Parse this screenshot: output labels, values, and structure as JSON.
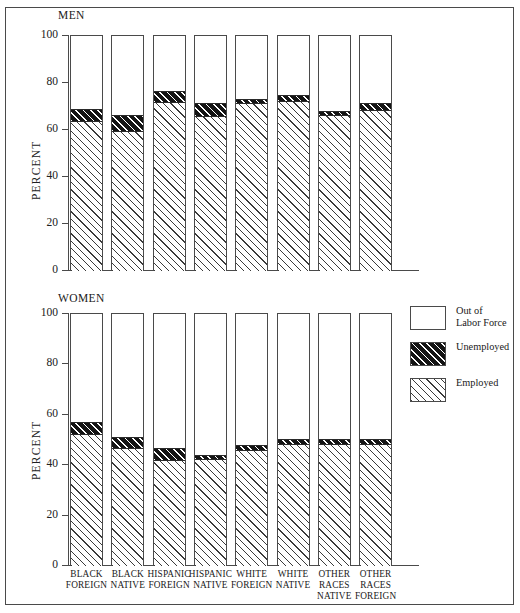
{
  "chart_data": {
    "type": "bar",
    "title": "",
    "subtype": "stacked-percentage",
    "panels": [
      {
        "name": "men",
        "label": "MEN",
        "ylabel": "PERCENT",
        "ylim": [
          0,
          100
        ],
        "yticks": [
          0,
          20,
          40,
          60,
          80,
          100
        ],
        "categories": [
          "BLACK FOREIGN",
          "BLACK NATIVE",
          "HISPANIC FOREIGN",
          "HISPANIC NATIVE",
          "WHITE FOREIGN",
          "WHITE NATIVE",
          "OTHER RACES NATIVE",
          "OTHER RACES FOREIGN"
        ],
        "series": [
          {
            "name": "Employed",
            "values": [
              63.5,
              59.0,
              71.5,
              65.5,
              71.0,
              72.0,
              66.0,
              68.0
            ]
          },
          {
            "name": "Unemployed",
            "values": [
              5.5,
              7.5,
              5.0,
              6.0,
              2.0,
              3.0,
              2.0,
              3.5
            ]
          },
          {
            "name": "Out of Labor Force",
            "values": [
              31.0,
              33.5,
              23.5,
              28.5,
              27.0,
              25.0,
              32.0,
              28.5
            ]
          }
        ]
      },
      {
        "name": "women",
        "label": "WOMEN",
        "ylabel": "PERCENT",
        "ylim": [
          0,
          100
        ],
        "yticks": [
          0,
          20,
          40,
          60,
          80,
          100
        ],
        "categories": [
          "BLACK FOREIGN",
          "BLACK NATIVE",
          "HISPANIC FOREIGN",
          "HISPANIC NATIVE",
          "WHITE FOREIGN",
          "WHITE NATIVE",
          "OTHER RACES NATIVE",
          "OTHER RACES FOREIGN"
        ],
        "series": [
          {
            "name": "Employed",
            "values": [
              52.0,
              46.5,
              41.5,
              42.0,
              45.5,
              48.0,
              48.0,
              48.0
            ]
          },
          {
            "name": "Unemployed",
            "values": [
              5.0,
              4.5,
              5.5,
              2.0,
              2.5,
              2.5,
              2.5,
              2.5
            ]
          },
          {
            "name": "Out of Labor Force",
            "values": [
              43.0,
              49.0,
              53.0,
              56.0,
              52.0,
              49.5,
              49.5,
              49.5
            ]
          }
        ]
      }
    ],
    "legend": {
      "position": "right",
      "entries": [
        {
          "key": "out",
          "label": "Out of\nLabor Force",
          "swatch": "white-empty"
        },
        {
          "key": "unemployed",
          "label": "Unemployed",
          "swatch": "dark-hatched"
        },
        {
          "key": "employed",
          "label": "Employed",
          "swatch": "light-hatched"
        }
      ]
    },
    "xtick_labels": [
      [
        "BLACK",
        "FOREIGN"
      ],
      [
        "BLACK",
        "NATIVE"
      ],
      [
        "HISPANIC",
        "FOREIGN"
      ],
      [
        "HISPANIC",
        "NATIVE"
      ],
      [
        "WHITE",
        "FOREIGN"
      ],
      [
        "WHITE",
        "NATIVE"
      ],
      [
        "OTHER",
        "RACES",
        "NATIVE"
      ],
      [
        "OTHER",
        "RACES",
        "FOREIGN"
      ]
    ],
    "colors": {
      "employed_fill": "#ffffff",
      "employed_hatch": "#3a3a3a",
      "unemployed_fill": "#141414",
      "unemployed_hatch": "#ffffff",
      "out_fill": "#ffffff",
      "outline": "#4a4a4a"
    }
  }
}
